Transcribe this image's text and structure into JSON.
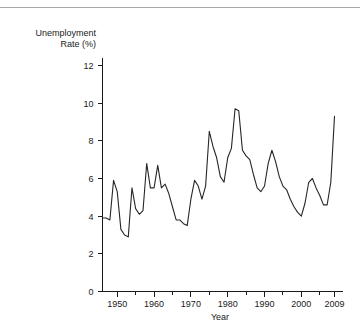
{
  "figure": {
    "has_top_rule": true,
    "rule_color": "#a8a8a8",
    "background": "#ffffff",
    "line_color": "#262626"
  },
  "axis": {
    "y_label_line1": "Unemployment",
    "y_label_line2": "Rate (%)",
    "x_label": "Year",
    "y_ticks": [
      "0",
      "2",
      "4",
      "6",
      "8",
      "10",
      "12"
    ],
    "x_ticks": [
      "1950",
      "1960",
      "1970",
      "1980",
      "1990",
      "2000",
      "2009"
    ]
  },
  "chart_data": {
    "type": "line",
    "title": "",
    "xlabel": "Year",
    "ylabel": "Unemployment Rate (%)",
    "xlim": [
      1946,
      2009
    ],
    "ylim": [
      0,
      13
    ],
    "ytick_values": [
      0,
      2,
      4,
      6,
      8,
      10,
      12
    ],
    "xtick_values": [
      1950,
      1960,
      1970,
      1980,
      1990,
      2000,
      2009
    ],
    "x_minor_tick_step": 5,
    "grid": false,
    "legend": false,
    "series": [
      {
        "name": "Unemployment Rate (%)",
        "x": [
          1946,
          1947,
          1948,
          1949,
          1950,
          1951,
          1952,
          1953,
          1954,
          1955,
          1956,
          1957,
          1958,
          1959,
          1960,
          1961,
          1962,
          1963,
          1964,
          1965,
          1966,
          1967,
          1968,
          1969,
          1970,
          1971,
          1972,
          1973,
          1974,
          1975,
          1976,
          1977,
          1978,
          1979,
          1980,
          1981,
          1982,
          1983,
          1984,
          1985,
          1986,
          1987,
          1988,
          1989,
          1990,
          1991,
          1992,
          1993,
          1994,
          1995,
          1996,
          1997,
          1998,
          1999,
          2000,
          2001,
          2002,
          2003,
          2004,
          2005,
          2006,
          2007,
          2008,
          2009
        ],
        "values": [
          3.9,
          3.9,
          3.8,
          5.9,
          5.3,
          3.3,
          3.0,
          2.9,
          5.5,
          4.4,
          4.1,
          4.3,
          6.8,
          5.5,
          5.5,
          6.7,
          5.5,
          5.7,
          5.2,
          4.5,
          3.8,
          3.8,
          3.6,
          3.5,
          4.9,
          5.9,
          5.6,
          4.9,
          5.6,
          8.5,
          7.7,
          7.1,
          6.1,
          5.8,
          7.1,
          7.6,
          9.7,
          9.6,
          7.5,
          7.2,
          7.0,
          6.2,
          5.5,
          5.3,
          5.6,
          6.8,
          7.5,
          6.9,
          6.1,
          5.6,
          5.4,
          4.9,
          4.5,
          4.2,
          4.0,
          4.7,
          5.8,
          6.0,
          5.5,
          5.1,
          4.6,
          4.6,
          5.8,
          9.3
        ]
      }
    ]
  }
}
